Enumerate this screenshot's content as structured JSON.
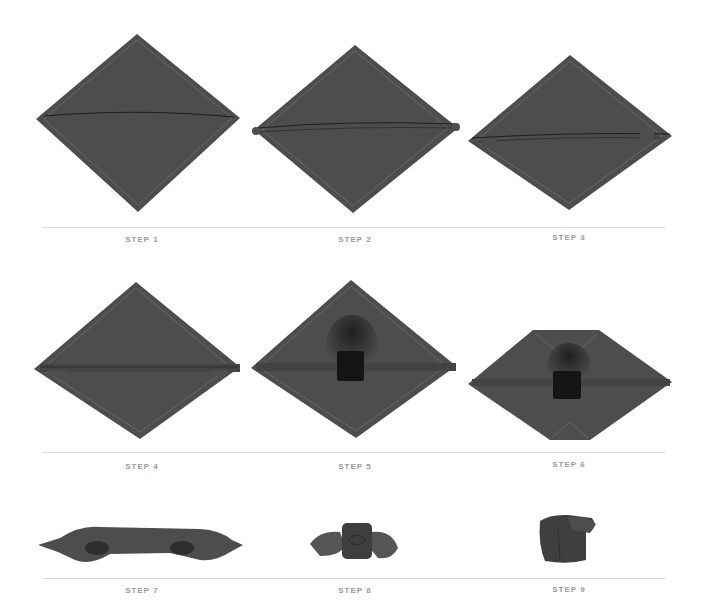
{
  "figure": {
    "fabric_color": "#4d4d4d",
    "fabric_edge_color": "#6e6e6e",
    "item_color": "#151515",
    "divider_color": "#d9d9d9",
    "label_color": "#9a9a9a"
  },
  "rows": [
    {
      "steps": [
        {
          "label": "STEP 1"
        },
        {
          "label": "STEP 2"
        },
        {
          "label": "STEP 3"
        }
      ]
    },
    {
      "steps": [
        {
          "label": "STEP 4"
        },
        {
          "label": "STEP 5"
        },
        {
          "label": "STEP 6"
        }
      ]
    },
    {
      "steps": [
        {
          "label": "STEP 7"
        },
        {
          "label": "STEP 8"
        },
        {
          "label": "STEP 9"
        }
      ]
    }
  ]
}
